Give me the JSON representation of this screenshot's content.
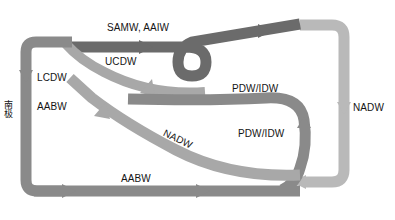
{
  "diagram": {
    "width": 395,
    "height": 220,
    "background_color": "#ffffff",
    "axis": {
      "left_label": "南极"
    },
    "colors": {
      "dark_gray": "#6b6b6b",
      "mid_gray": "#8a8a8a",
      "light_gray": "#a8a8a8",
      "pale_gray": "#b9b9b9",
      "text": "#141414"
    },
    "labels": [
      {
        "id": "samw-aaiw",
        "text": "SAMW, AAIW",
        "x": 107,
        "y": 23,
        "rotation": 0
      },
      {
        "id": "ucdw",
        "text": "UCDW",
        "x": 105,
        "y": 57,
        "rotation": 0
      },
      {
        "id": "lcdw",
        "text": "LCDW",
        "x": 37,
        "y": 73,
        "rotation": 0
      },
      {
        "id": "aabw-left",
        "text": "AABW",
        "x": 37,
        "y": 102,
        "rotation": 0
      },
      {
        "id": "pdw-idw-up",
        "text": "PDW/IDW",
        "x": 232,
        "y": 84,
        "rotation": 0
      },
      {
        "id": "pdw-idw-low",
        "text": "PDW/IDW",
        "x": 238,
        "y": 129,
        "rotation": 0
      },
      {
        "id": "nadw-right",
        "text": "NADW",
        "x": 353,
        "y": 103,
        "rotation": 0
      },
      {
        "id": "nadw-mid",
        "text": "NADW",
        "x": 166,
        "y": 128,
        "rotation": 26
      },
      {
        "id": "aabw-bottom",
        "text": "AABW",
        "x": 121,
        "y": 174,
        "rotation": 0
      }
    ],
    "flows": [
      {
        "id": "samw-aaiw-flow",
        "label": "SAMW, AAIW",
        "water_mass": "Subantarctic Mode Water / Antarctic Intermediate Water",
        "direction": "northward-upper",
        "color": "#6b6b6b"
      },
      {
        "id": "ucdw-flow",
        "label": "UCDW",
        "water_mass": "Upper Circumpolar Deep Water",
        "direction": "southward",
        "color": "#a8a8a8"
      },
      {
        "id": "lcdw-flow",
        "label": "LCDW",
        "water_mass": "Lower Circumpolar Deep Water",
        "direction": "southward-descending",
        "color": "#8a8a8a"
      },
      {
        "id": "aabw-flow",
        "label": "AABW",
        "water_mass": "Antarctic Bottom Water",
        "direction": "northward-bottom",
        "color": "#8a8a8a"
      },
      {
        "id": "nadw-flow",
        "label": "NADW",
        "water_mass": "North Atlantic Deep Water",
        "direction": "southward-deep",
        "color": "#a8a8a8"
      },
      {
        "id": "pdw-idw-flow",
        "label": "PDW/IDW",
        "water_mass": "Pacific Deep Water / Indian Deep Water",
        "direction": "upwelling-return",
        "color": "#8a8a8a"
      }
    ]
  }
}
